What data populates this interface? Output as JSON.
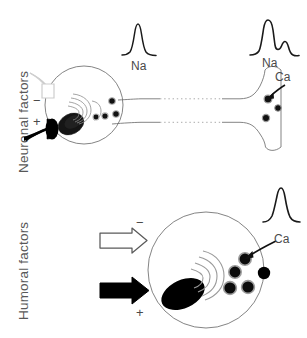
{
  "figure": {
    "background_color": "#ffffff",
    "stroke_color": "#4a4a4a",
    "fill_color": "#000000",
    "text_color": "#585858"
  },
  "panels": [
    {
      "id": "neuronal",
      "row_label": "Neuronal factors",
      "inputs": [
        {
          "id": "inhibitory",
          "sign": "−",
          "style": "outlined-bouton",
          "name": "inhibitory-synapse"
        },
        {
          "id": "excitatory",
          "sign": "+",
          "style": "filled-bouton",
          "name": "excitatory-synapse"
        }
      ],
      "traces": [
        {
          "id": "soma-spike",
          "label": "Na",
          "shape": "narrow-spike"
        },
        {
          "id": "terminal-spike",
          "labels": [
            "Na",
            "Ca"
          ],
          "shape": "broad-spike-with-shoulder"
        }
      ],
      "annotations": [
        {
          "id": "ca-arrow-terminal",
          "label": "Ca",
          "target": "terminal-vesicle"
        }
      ],
      "cell": {
        "soma": "circle",
        "nucleus": "filled-ellipse",
        "golgi": "concentric-arcs",
        "vesicle_count": 4,
        "axon": "interrupted-dashed",
        "terminal_vesicle_count": 3
      }
    },
    {
      "id": "humoral",
      "row_label": "Humoral factors",
      "inputs": [
        {
          "id": "inhibitory",
          "sign": "−",
          "style": "outlined-arrow",
          "name": "inhibitory-arrow"
        },
        {
          "id": "excitatory",
          "sign": "+",
          "style": "filled-arrow",
          "name": "excitatory-arrow"
        }
      ],
      "traces": [
        {
          "id": "secretion-spike",
          "label": "",
          "shape": "narrow-spike"
        }
      ],
      "annotations": [
        {
          "id": "ca-arrow-soma",
          "label": "Ca",
          "target": "membrane-vesicle"
        }
      ],
      "cell": {
        "soma": "circle",
        "nucleus": "filled-ellipse",
        "golgi": "concentric-arcs",
        "vesicle_count": 4,
        "released_granule_count": 1
      }
    }
  ],
  "labels": {
    "na": "Na",
    "ca": "Ca",
    "minus": "−",
    "plus": "+"
  }
}
